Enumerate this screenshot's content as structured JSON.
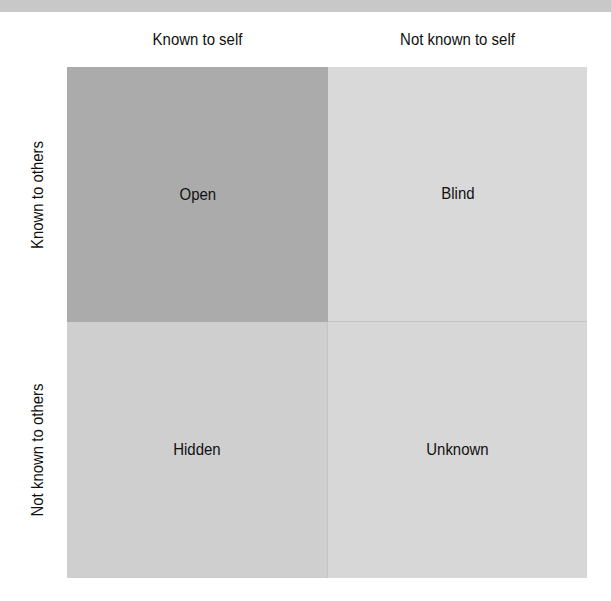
{
  "diagram": {
    "type": "johari-window",
    "top_band_color": "#c8c8c8",
    "columns": [
      {
        "label": "Known to self"
      },
      {
        "label": "Not known to self"
      }
    ],
    "rows": [
      {
        "label": "Known to others"
      },
      {
        "label": "Not known to others"
      }
    ],
    "quadrants": [
      {
        "label": "Open",
        "color": "#ababab",
        "row": 0,
        "col": 0
      },
      {
        "label": "Blind",
        "color": "#d9d9d9",
        "row": 0,
        "col": 1
      },
      {
        "label": "Hidden",
        "color": "#cfcfcf",
        "row": 1,
        "col": 0
      },
      {
        "label": "Unknown",
        "color": "#d7d7d7",
        "row": 1,
        "col": 1
      }
    ]
  }
}
